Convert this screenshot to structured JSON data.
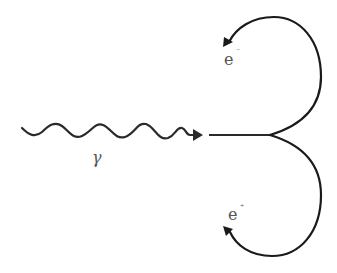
{
  "diagram": {
    "type": "pair-production",
    "photon": {
      "label": "γ",
      "color": "#222222"
    },
    "electron": {
      "label": "e",
      "charge": "⁻",
      "color": "#222222"
    },
    "positron": {
      "label": "e",
      "charge": "⁺",
      "color": "#222222"
    },
    "label_color": "#555555"
  }
}
